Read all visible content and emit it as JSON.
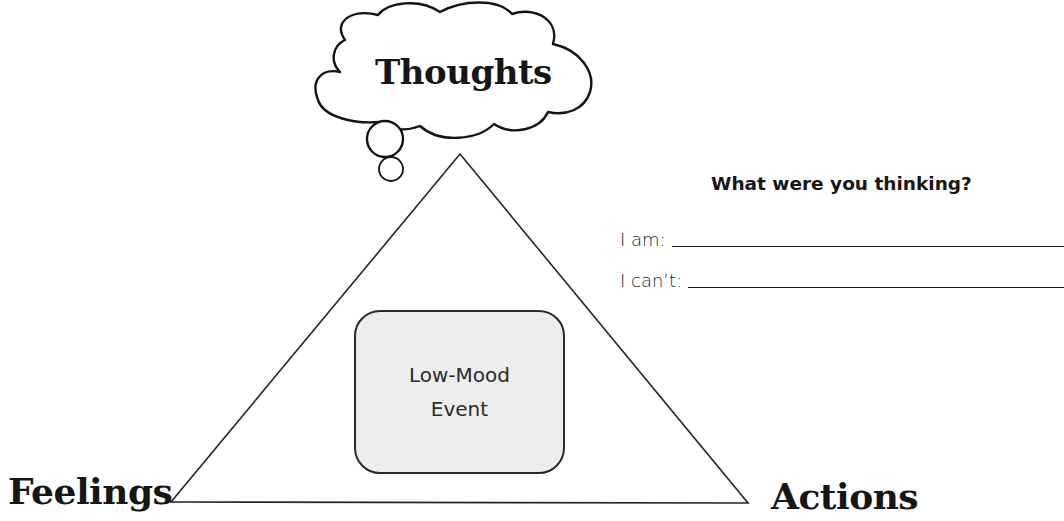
{
  "diagram": {
    "type": "cognitive-triangle",
    "nodes": {
      "top": "Thoughts",
      "bottom_left": "Feelings",
      "bottom_right": "Actions"
    },
    "center": {
      "lines": [
        "Low-Mood",
        "Event"
      ]
    }
  },
  "prompt": {
    "title": "What were you thinking?",
    "rows": [
      {
        "label": "I am:",
        "value": ""
      },
      {
        "label": "I can’t:",
        "value": ""
      }
    ]
  },
  "colors": {
    "stroke": "#1a1a1a",
    "event_fill": "#ededed",
    "background": "#ffffff"
  }
}
